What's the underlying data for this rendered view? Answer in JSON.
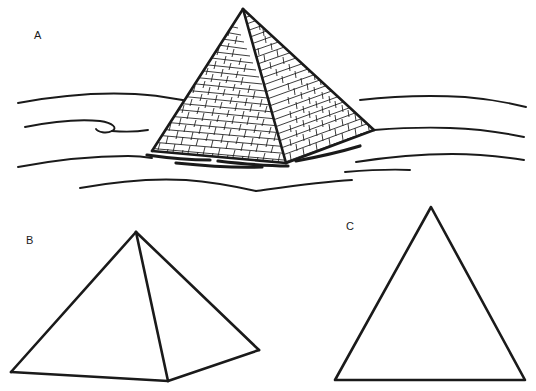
{
  "figure": {
    "kind": "line-drawing",
    "background_color": "#ffffff",
    "ink_color": "#1a1a1a",
    "width": 536,
    "height": 391,
    "panels": [
      {
        "id": "A",
        "label": "A",
        "label_x": 34,
        "label_y": 30,
        "title": "brick pyramid in desert",
        "description": "Great-pyramid style stepped masonry pyramid with two visible faces shown in three-quarter view, standing on a desert plain drawn with wavy dune contour lines."
      },
      {
        "id": "B",
        "label": "B",
        "label_x": 26,
        "label_y": 235,
        "title": "pyramid outline",
        "description": "Plain three-dimensional pyramid outline with two visible faces and a visible front vertical edge, no surface texture."
      },
      {
        "id": "C",
        "label": "C",
        "label_x": 346,
        "label_y": 221,
        "title": "triangle outline",
        "description": "Plain two-dimensional isosceles triangle outline."
      }
    ]
  },
  "geometry": {
    "pyramid_a": {
      "apex": [
        243,
        9
      ],
      "left_base": [
        152,
        151
      ],
      "front_base": [
        286,
        163
      ],
      "right_base": [
        374,
        130
      ],
      "left_face_bricks": 22,
      "right_face_bricks": 22
    },
    "pyramid_b": {
      "apex": [
        136,
        232
      ],
      "left_base": [
        11,
        372
      ],
      "front_base": [
        168,
        381
      ],
      "right_base": [
        259,
        350
      ]
    },
    "triangle_c": {
      "apex": [
        431,
        207
      ],
      "left_base": [
        335,
        380
      ],
      "right_base": [
        525,
        380
      ]
    },
    "dune_lines": 8,
    "shadow_strokes": 4
  },
  "strokes": {
    "outline_width_px": 2.4,
    "brick_joint_width_px": 0.8,
    "dune_width_px": 1.9,
    "shadow_width_px": 3.2
  }
}
